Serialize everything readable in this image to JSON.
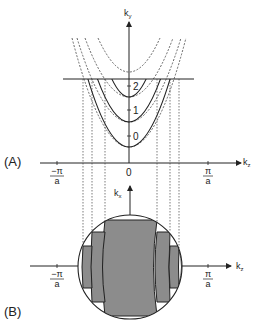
{
  "figure": {
    "panel_a": {
      "label": "(A)",
      "vertical_axis": {
        "label": "k",
        "subscript": "y"
      },
      "horizontal_axis": {
        "label": "k",
        "subscript": "z"
      },
      "origin_label": "0",
      "left_tick": {
        "numerator": "−π",
        "denominator": "a"
      },
      "right_tick": {
        "numerator": "π",
        "denominator": "a"
      },
      "band_labels": [
        "2",
        "1",
        "0"
      ],
      "solid_parabola_count": 3,
      "dashed_parabola_count": 4
    },
    "panel_b": {
      "label": "(B)",
      "vertical_axis": {
        "label": "k",
        "subscript": "x"
      },
      "horizontal_axis": {
        "label": "k",
        "subscript": "z"
      },
      "left_tick": {
        "numerator": "−π",
        "denominator": "a"
      },
      "right_tick": {
        "numerator": "π",
        "denominator": "a"
      }
    },
    "colors": {
      "line": "#222222",
      "fill": "#8c8c8c",
      "dotted": "#444444"
    }
  }
}
